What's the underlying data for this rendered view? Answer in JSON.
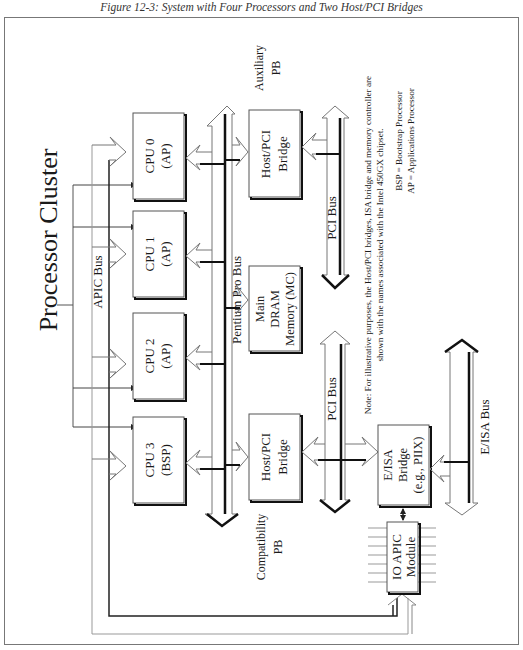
{
  "figure": {
    "caption": "Figure 12-3: System with Four Processors and Two Host/PCI Bridges",
    "orientation": "rotated 90° counter-clockwise",
    "title": "Processor Cluster"
  },
  "processors": [
    {
      "id": "cpu0",
      "name": "CPU 0",
      "role": "(AP)"
    },
    {
      "id": "cpu1",
      "name": "CPU 1",
      "role": "(AP)"
    },
    {
      "id": "cpu2",
      "name": "CPU 2",
      "role": "(AP)"
    },
    {
      "id": "cpu3",
      "name": "CPU 3",
      "role": "(BSP)"
    }
  ],
  "buses": {
    "apic": "APIC Bus",
    "pentium_pro": "Pentium Pro Bus",
    "pci_aux": "PCI Bus",
    "pci_compat": "PCI Bus",
    "eisa": "E/ISA Bus"
  },
  "components": {
    "host_pci_aux": {
      "line1": "Host/PCI",
      "line2": "Bridge",
      "label_line1": "Auxiliary",
      "label_line2": "PB"
    },
    "main_dram": {
      "line1": "Main",
      "line2": "DRAM",
      "line3": "Memory (MC)"
    },
    "host_pci_compat": {
      "line1": "Host/PCI",
      "line2": "Bridge",
      "label_line1": "Compatibility",
      "label_line2": "PB"
    },
    "eisa_bridge": {
      "line1": "E/ISA",
      "line2": "Bridge",
      "line3": "(e.g., PIIX)"
    },
    "io_apic": {
      "line1": "IO APIC",
      "line2": "Module"
    }
  },
  "notes": {
    "note_line1": "Note: For illustrative purposes, the Host/PCI bridges, ISA bridge and memory controller are",
    "note_line2": "shown with the names associated with the Intel 450GX chipset.",
    "legend_bsp": "BSP = Bootstrap Processor",
    "legend_ap": "AP = Applications Processor"
  }
}
